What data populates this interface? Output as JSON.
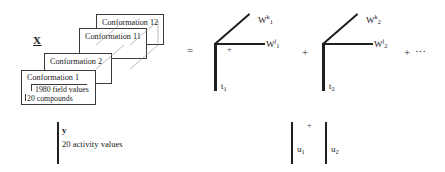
{
  "diagram": {
    "type": "tensor-decomposition",
    "tensor_label": "X",
    "operators": {
      "equals": "=",
      "plus": "+",
      "plus_small": "+",
      "continuation": "+ ⋯"
    },
    "slabs": [
      {
        "id": "slab-4",
        "title": "Conformation 12"
      },
      {
        "id": "slab-3",
        "title": "Conformation 11"
      },
      {
        "id": "slab-2",
        "title": "Conformation 2"
      },
      {
        "id": "slab-1",
        "title": "Conformation 1"
      }
    ],
    "front_slab_annotations": {
      "columns_label": "1980 field values",
      "rows_label": "20 compounds"
    },
    "terms": [
      {
        "score_vector": "t",
        "score_index": "1",
        "weight_j": "W",
        "weight_j_sub": "1",
        "weight_j_sup": "j",
        "weight_k": "W",
        "weight_k_sub": "1",
        "weight_k_sup": "k"
      },
      {
        "score_vector": "t",
        "score_index": "2",
        "weight_j": "W",
        "weight_j_sub": "2",
        "weight_j_sup": "j",
        "weight_k": "W",
        "weight_k_sub": "2",
        "weight_k_sup": "k"
      }
    ],
    "response": {
      "vector_label": "y",
      "description": "20 activity values",
      "components": [
        {
          "name": "u",
          "index": "1"
        },
        {
          "name": "u",
          "index": "2"
        }
      ]
    },
    "colors": {
      "ink": "#1f1f1f",
      "box_stroke": "#3a3a3a",
      "background": "#ffffff"
    }
  }
}
